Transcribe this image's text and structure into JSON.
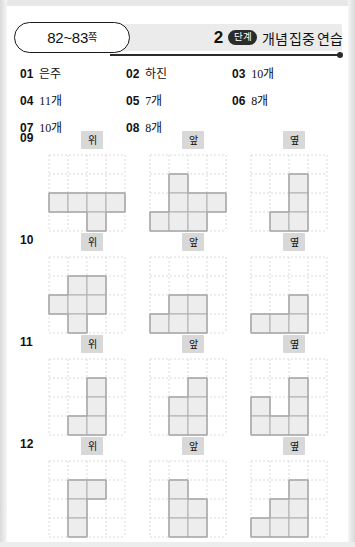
{
  "header": {
    "page_range": "82~83",
    "page_suffix": "쪽",
    "step_number": "2",
    "step_badge": "단계",
    "title_part1": "개념",
    "title_part2": "집중 연습"
  },
  "answers": [
    [
      {
        "no": "01",
        "value": "은주"
      },
      {
        "no": "02",
        "value": "하진"
      },
      {
        "no": "03",
        "value": "10개"
      }
    ],
    [
      {
        "no": "04",
        "value": "11개"
      },
      {
        "no": "05",
        "value": "7개"
      },
      {
        "no": "06",
        "value": "8개"
      }
    ],
    [
      {
        "no": "07",
        "value": "10개"
      },
      {
        "no": "08",
        "value": "8개"
      },
      {
        "no": "",
        "value": ""
      }
    ]
  ],
  "view_labels": {
    "top": "위",
    "front": "앞",
    "side": "옆"
  },
  "problems": [
    {
      "no": "09",
      "views": [
        {
          "label": "위",
          "rows": 4,
          "cols": 4,
          "cells": [
            [
              3,
              1
            ],
            [
              3,
              2
            ],
            [
              3,
              3
            ],
            [
              3,
              4
            ],
            [
              4,
              3
            ]
          ]
        },
        {
          "label": "앞",
          "rows": 4,
          "cols": 4,
          "cells": [
            [
              2,
              2
            ],
            [
              3,
              2
            ],
            [
              3,
              3
            ],
            [
              3,
              4
            ],
            [
              4,
              1
            ],
            [
              4,
              2
            ],
            [
              4,
              3
            ]
          ]
        },
        {
          "label": "옆",
          "rows": 4,
          "cols": 4,
          "cells": [
            [
              2,
              3
            ],
            [
              3,
              3
            ],
            [
              4,
              2
            ],
            [
              4,
              3
            ]
          ]
        }
      ]
    },
    {
      "no": "10",
      "views": [
        {
          "label": "위",
          "rows": 4,
          "cols": 4,
          "cells": [
            [
              2,
              2
            ],
            [
              2,
              3
            ],
            [
              3,
              1
            ],
            [
              3,
              2
            ],
            [
              3,
              3
            ],
            [
              4,
              2
            ]
          ]
        },
        {
          "label": "앞",
          "rows": 4,
          "cols": 4,
          "cells": [
            [
              3,
              2
            ],
            [
              3,
              3
            ],
            [
              4,
              1
            ],
            [
              4,
              2
            ],
            [
              4,
              3
            ]
          ]
        },
        {
          "label": "옆",
          "rows": 4,
          "cols": 4,
          "cells": [
            [
              3,
              3
            ],
            [
              4,
              1
            ],
            [
              4,
              2
            ],
            [
              4,
              3
            ]
          ]
        }
      ]
    },
    {
      "no": "11",
      "views": [
        {
          "label": "위",
          "rows": 4,
          "cols": 4,
          "cells": [
            [
              2,
              3
            ],
            [
              3,
              3
            ],
            [
              4,
              2
            ],
            [
              4,
              3
            ]
          ]
        },
        {
          "label": "앞",
          "rows": 4,
          "cols": 4,
          "cells": [
            [
              2,
              3
            ],
            [
              3,
              2
            ],
            [
              3,
              3
            ],
            [
              4,
              2
            ],
            [
              4,
              3
            ]
          ]
        },
        {
          "label": "옆",
          "rows": 4,
          "cols": 4,
          "cells": [
            [
              2,
              3
            ],
            [
              3,
              1
            ],
            [
              3,
              3
            ],
            [
              4,
              1
            ],
            [
              4,
              2
            ],
            [
              4,
              3
            ]
          ]
        }
      ]
    },
    {
      "no": "12",
      "views": [
        {
          "label": "위",
          "rows": 4,
          "cols": 4,
          "cells": [
            [
              2,
              2
            ],
            [
              2,
              3
            ],
            [
              3,
              2
            ],
            [
              4,
              2
            ]
          ]
        },
        {
          "label": "앞",
          "rows": 4,
          "cols": 4,
          "cells": [
            [
              2,
              2
            ],
            [
              3,
              2
            ],
            [
              3,
              3
            ],
            [
              4,
              2
            ],
            [
              4,
              3
            ]
          ]
        },
        {
          "label": "옆",
          "rows": 4,
          "cols": 4,
          "cells": [
            [
              2,
              3
            ],
            [
              3,
              2
            ],
            [
              3,
              3
            ],
            [
              4,
              1
            ],
            [
              4,
              2
            ],
            [
              4,
              3
            ]
          ]
        }
      ]
    }
  ],
  "layout": {
    "problem_tops": [
      131,
      233,
      335,
      437
    ]
  },
  "colors": {
    "fill": "#ededed",
    "stroke": "#b4b4b4",
    "dotted": "#d2d2d2",
    "badge_bg": "#d8d8d8",
    "step_badge_bg": "#2b2b2b",
    "text": "#111111"
  }
}
